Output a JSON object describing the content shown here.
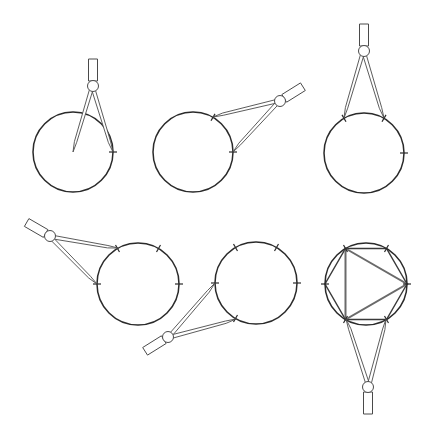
{
  "diagram": {
    "title": "",
    "colors": {
      "background": "#ffffff",
      "circle_stroke": "#2a2a2a",
      "compass_stroke": "#4a4a4a",
      "hexagon_stroke": "#3a3a3a",
      "triangle_stroke": "#6a6a6a"
    },
    "steps": [
      {
        "id": 1,
        "label": "",
        "circle": {
          "cx": 73,
          "cy": 152,
          "r": 40
        },
        "tick_angles_deg": [
          0
        ],
        "compass": {
          "hinge": [
            93,
            86
          ],
          "tipA": [
            73,
            152
          ],
          "tipB": [
            113,
            152
          ],
          "handle_angle_deg": -90
        },
        "description": "Draw the circle with compass centered; mark a point on the circumference"
      },
      {
        "id": 2,
        "label": "",
        "circle": {
          "cx": 193,
          "cy": 152,
          "r": 40
        },
        "tick_angles_deg": [
          0,
          -60
        ],
        "compass": {
          "hinge": [
            280,
            101
          ],
          "tipA": [
            233,
            152
          ],
          "tipB": [
            213,
            117
          ],
          "handle_angle_deg": -32
        },
        "description": "With same radius, step off an arc from the marked point"
      },
      {
        "id": 3,
        "label": "",
        "circle": {
          "cx": 364,
          "cy": 153,
          "r": 40
        },
        "tick_angles_deg": [
          0,
          -60,
          -120
        ],
        "compass": {
          "hinge": [
            364,
            51
          ],
          "tipA": [
            384,
            118
          ],
          "tipB": [
            344,
            118
          ],
          "handle_angle_deg": -90
        },
        "description": "Continue stepping around the circumference"
      },
      {
        "id": 4,
        "label": "",
        "circle": {
          "cx": 138,
          "cy": 284,
          "r": 41
        },
        "tick_angles_deg": [
          0,
          -60,
          -120,
          180
        ],
        "compass": {
          "hinge": [
            50,
            236
          ],
          "tipA": [
            118,
            248
          ],
          "tipB": [
            97,
            284
          ],
          "handle_angle_deg": 210
        },
        "description": "Continue stepping; fourth mark placed"
      },
      {
        "id": 5,
        "label": "",
        "circle": {
          "cx": 256,
          "cy": 283,
          "r": 41
        },
        "tick_angles_deg": [
          0,
          -60,
          -120,
          180,
          120
        ],
        "compass": {
          "hinge": [
            168,
            337
          ],
          "tipA": [
            215,
            283
          ],
          "tipB": [
            236,
            319
          ],
          "handle_angle_deg": 148
        },
        "description": "Fifth mark placed; six equal divisions complete"
      },
      {
        "id": 6,
        "label": "",
        "circle": {
          "cx": 366,
          "cy": 284,
          "r": 41
        },
        "tick_angles_deg": [
          0,
          -60,
          -120,
          180,
          120,
          60
        ],
        "hexagon": true,
        "triangle_vertex_angles_deg": [
          -120,
          0,
          120
        ],
        "compass": {
          "hinge": [
            368,
            387
          ],
          "tipA": [
            346,
            319
          ],
          "tipB": [
            386,
            319
          ],
          "handle_angle_deg": 90
        },
        "description": "Join alternate points for an equilateral triangle; join all six for a regular hexagon"
      }
    ]
  }
}
